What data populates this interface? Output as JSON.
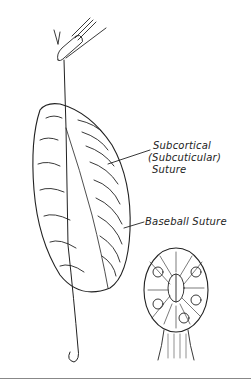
{
  "figure": {
    "labels": {
      "subcortical_line1": "Subcortical",
      "subcortical_line2": "(Subcuticular)",
      "subcortical_line3": "Suture",
      "baseball": "Baseball Suture"
    },
    "parts": [
      "needle-holder",
      "suture-thread",
      "specimen-with-suture",
      "cross-section",
      "needle-tip"
    ],
    "colors": {
      "ink": "#222222",
      "background": "#ffffff",
      "rule": "#888888"
    }
  }
}
